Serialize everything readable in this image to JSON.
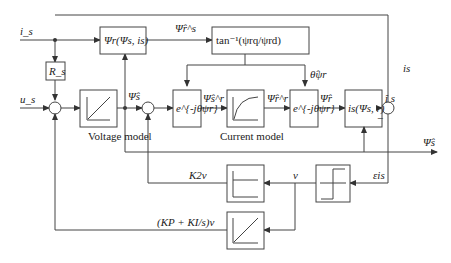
{
  "diagram": {
    "inputs": {
      "current": "i_s",
      "voltage": "u_s"
    },
    "blocks": {
      "resistor": "R_s",
      "flux_calc": "Ψr(Ψs, is)",
      "angle_calc": "tan⁻¹(ψrq/ψrd)",
      "rot1": "e^{-jθψr}",
      "rot2": "e^{-jθψr}",
      "current_calc": "is(Ψs, r)"
    },
    "labels": {
      "voltage_model": "Voltage model",
      "current_model": "Current model",
      "psi_r_s": "Ψ̂r^s",
      "psi_s": "Ψ̂s",
      "psi_s_r": "Ψ̂s^r",
      "psi_r_r": "Ψ̂r^r",
      "psi_r": "Ψ̂r",
      "theta": "θ̂ψr",
      "i_s_hat": "î s",
      "i_s_right": "is",
      "minus": "−",
      "psi_s_out": "Ψ̂s",
      "error": "εis",
      "v": "v",
      "k2v": "K2v",
      "pi_v": "(KP + KI/s)v"
    }
  }
}
